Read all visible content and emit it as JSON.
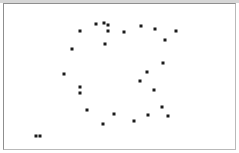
{
  "figure": {
    "width": 239,
    "height": 153,
    "background_color": "#ffffff",
    "frame_color": "#8f8f8f",
    "marker_color": "#1b1b1b",
    "marker_size_px": 3,
    "marker_shape": "square"
  },
  "chart_data": {
    "type": "scatter",
    "title": "",
    "subtitle": "",
    "xlabel": "",
    "ylabel": "",
    "xlim": [
      0,
      239
    ],
    "ylim": [
      153,
      0
    ],
    "grid": false,
    "legend": null,
    "axis_ticks": {
      "x": [],
      "y": []
    },
    "annotations": [],
    "series": [
      {
        "name": "points",
        "marker": "square",
        "color": "#1b1b1b",
        "n_points": 32,
        "points": [
          {
            "x": 96,
            "y": 24
          },
          {
            "x": 104,
            "y": 23
          },
          {
            "x": 108,
            "y": 25
          },
          {
            "x": 80,
            "y": 31
          },
          {
            "x": 108,
            "y": 31
          },
          {
            "x": 124,
            "y": 32
          },
          {
            "x": 141,
            "y": 26
          },
          {
            "x": 155,
            "y": 29
          },
          {
            "x": 176,
            "y": 31
          },
          {
            "x": 165,
            "y": 40
          },
          {
            "x": 105,
            "y": 44
          },
          {
            "x": 72,
            "y": 49
          },
          {
            "x": 163,
            "y": 63
          },
          {
            "x": 64,
            "y": 74
          },
          {
            "x": 147,
            "y": 72
          },
          {
            "x": 140,
            "y": 81
          },
          {
            "x": 80,
            "y": 87
          },
          {
            "x": 80,
            "y": 93
          },
          {
            "x": 154,
            "y": 90
          },
          {
            "x": 162,
            "y": 107
          },
          {
            "x": 87,
            "y": 110
          },
          {
            "x": 114,
            "y": 114
          },
          {
            "x": 148,
            "y": 115
          },
          {
            "x": 168,
            "y": 116
          },
          {
            "x": 134,
            "y": 121
          },
          {
            "x": 103,
            "y": 124
          },
          {
            "x": 36,
            "y": 136
          },
          {
            "x": 40,
            "y": 136
          }
        ]
      }
    ]
  }
}
